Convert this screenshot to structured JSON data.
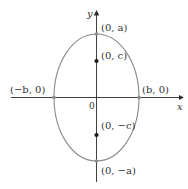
{
  "figure": {
    "type": "ellipse-with-foci",
    "colors": {
      "axis": "#2a2a2a",
      "ellipse": "#8a8a8a",
      "point": "#1a1a1a",
      "text": "#333333"
    },
    "axes": {
      "x_label": "x",
      "y_label": "y",
      "origin_label": "0"
    },
    "labels": {
      "top_vertex": "(0, a)",
      "focus_top": "(0, c)",
      "left_vertex": "(−b, 0)",
      "right_vertex": "(b, 0)",
      "focus_bottom": "(0, −c)",
      "bottom_vertex": "(0, −a)"
    }
  }
}
